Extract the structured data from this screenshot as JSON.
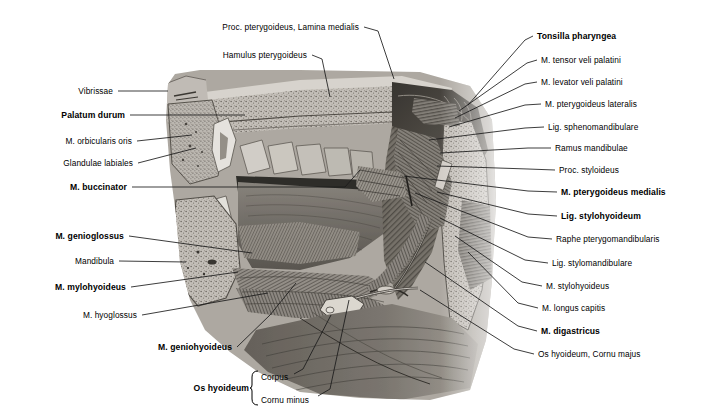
{
  "figure": {
    "background_color": "#ffffff",
    "text_color": "#000000",
    "leader_line_color": "#1a1a1a",
    "illustration": {
      "name": "head-neck-sagittal-halftone-illustration",
      "bounds": {
        "x": 155,
        "y": 70,
        "width": 343,
        "height": 330
      },
      "style": "grayscale halftone anatomical engraving"
    }
  },
  "labels_top": [
    {
      "id": "proc-pterygoideus-lamina-medialis",
      "text": "Proc. pterygoideus, Lamina medialis",
      "bold": false,
      "anchor": "right",
      "tx": 359,
      "ty": 27,
      "line": [
        [
          364,
          27
        ],
        [
          378,
          31
        ],
        [
          394,
          79
        ]
      ]
    },
    {
      "id": "hamulus-pterygoideus",
      "text": "Hamulus pterygoideus",
      "bold": false,
      "anchor": "right",
      "tx": 307,
      "ty": 55,
      "line": [
        [
          312,
          55
        ],
        [
          322,
          59
        ],
        [
          330,
          97
        ]
      ]
    }
  ],
  "labels_left": [
    {
      "id": "vibrissae",
      "text": "Vibrissae",
      "bold": false,
      "anchor": "right",
      "tx": 113,
      "ty": 91,
      "line": [
        [
          118,
          91
        ],
        [
          168,
          91
        ]
      ]
    },
    {
      "id": "palatum-durum",
      "text": "Palatum durum",
      "bold": true,
      "anchor": "right",
      "tx": 125,
      "ty": 115,
      "line": [
        [
          130,
          115
        ],
        [
          245,
          115
        ]
      ]
    },
    {
      "id": "m-orbicularis-oris",
      "text": "M. orbicularis oris",
      "bold": false,
      "anchor": "right",
      "tx": 132,
      "ty": 141,
      "line": [
        [
          137,
          141
        ],
        [
          192,
          135
        ]
      ]
    },
    {
      "id": "glandulae-labiales",
      "text": "Glandulae labiales",
      "bold": false,
      "anchor": "right",
      "tx": 133,
      "ty": 163,
      "line": [
        [
          138,
          163
        ],
        [
          196,
          148
        ]
      ]
    },
    {
      "id": "m-buccinator",
      "text": "M. buccinator",
      "bold": true,
      "anchor": "right",
      "tx": 127,
      "ty": 187,
      "line": [
        [
          132,
          187
        ],
        [
          345,
          187
        ],
        [
          360,
          170
        ]
      ]
    },
    {
      "id": "m-genioglossus",
      "text": "M. genioglossus",
      "bold": true,
      "anchor": "right",
      "tx": 124,
      "ty": 236,
      "line": [
        [
          129,
          236
        ],
        [
          252,
          253
        ]
      ]
    },
    {
      "id": "mandibula",
      "text": "Mandibula",
      "bold": false,
      "anchor": "right",
      "tx": 114,
      "ty": 261,
      "line": [
        [
          119,
          261
        ],
        [
          186,
          262
        ]
      ]
    },
    {
      "id": "m-mylohyoideus",
      "text": "M. mylohyoideus",
      "bold": true,
      "anchor": "right",
      "tx": 126,
      "ty": 287,
      "line": [
        [
          131,
          287
        ],
        [
          238,
          272
        ]
      ]
    },
    {
      "id": "m-hyoglossus",
      "text": "M. hyoglossus",
      "bold": false,
      "anchor": "right",
      "tx": 137,
      "ty": 315,
      "line": [
        [
          142,
          315
        ],
        [
          268,
          293
        ]
      ]
    },
    {
      "id": "m-geniohyoideus",
      "text": "M. geniohyoideus",
      "bold": true,
      "anchor": "right",
      "tx": 232,
      "ty": 347,
      "line": [
        [
          237,
          347
        ],
        [
          270,
          315
        ],
        [
          296,
          283
        ]
      ]
    }
  ],
  "labels_bottom": {
    "group_label": {
      "id": "os-hyoideum",
      "text": "Os hyoideum",
      "bold": true,
      "anchor": "right",
      "tx": 249,
      "ty": 388
    },
    "brace": {
      "x": 252,
      "y_top": 371,
      "y_bottom": 405,
      "width": 6
    },
    "items": [
      {
        "id": "os-hyoideum-corpus",
        "text": "Corpus",
        "bold": false,
        "anchor": "left",
        "tx": 261,
        "ty": 377,
        "line": [
          [
            294,
            374
          ],
          [
            303,
            369
          ],
          [
            331,
            315
          ]
        ]
      },
      {
        "id": "os-hyoideum-cornu-minus",
        "text": "Cornu minus",
        "bold": false,
        "anchor": "left",
        "tx": 261,
        "ty": 400,
        "line": [
          [
            318,
            396
          ],
          [
            330,
            389
          ],
          [
            349,
            300
          ]
        ]
      }
    ]
  },
  "labels_right": [
    {
      "id": "tonsilla-pharyngea",
      "text": "Tonsilla pharyngea",
      "bold": true,
      "anchor": "left",
      "tx": 537,
      "ty": 36,
      "line": [
        [
          533,
          36
        ],
        [
          525,
          40
        ],
        [
          468,
          105
        ]
      ]
    },
    {
      "id": "m-tensor-veli-palatini",
      "text": "M. tensor veli palatini",
      "bold": false,
      "anchor": "left",
      "tx": 541,
      "ty": 60,
      "line": [
        [
          537,
          60
        ],
        [
          527,
          63
        ],
        [
          459,
          111
        ]
      ]
    },
    {
      "id": "m-levator-veli-palatini",
      "text": "M. levator veli palatini",
      "bold": false,
      "anchor": "left",
      "tx": 541,
      "ty": 82,
      "line": [
        [
          537,
          82
        ],
        [
          525,
          84
        ],
        [
          455,
          118
        ]
      ]
    },
    {
      "id": "m-pterygoideus-lateralis",
      "text": "M. pterygoideus lateralis",
      "bold": false,
      "anchor": "left",
      "tx": 545,
      "ty": 104,
      "line": [
        [
          541,
          104
        ],
        [
          525,
          105
        ],
        [
          449,
          127
        ]
      ]
    },
    {
      "id": "lig-sphenomandibulare",
      "text": "Lig. sphenomandibulare",
      "bold": false,
      "anchor": "left",
      "tx": 548,
      "ty": 127,
      "line": [
        [
          544,
          127
        ],
        [
          525,
          128
        ],
        [
          429,
          140
        ]
      ]
    },
    {
      "id": "ramus-mandibulae",
      "text": "Ramus mandibulae",
      "bold": false,
      "anchor": "left",
      "tx": 555,
      "ty": 148,
      "line": [
        [
          551,
          148
        ],
        [
          528,
          148
        ],
        [
          440,
          153
        ]
      ]
    },
    {
      "id": "proc-styloideus",
      "text": "Proc. styloideus",
      "bold": false,
      "anchor": "left",
      "tx": 559,
      "ty": 170,
      "line": [
        [
          555,
          170
        ],
        [
          528,
          169
        ],
        [
          437,
          166
        ]
      ]
    },
    {
      "id": "m-pterygoideus-medialis",
      "text": "M. pterygoideus medialis",
      "bold": true,
      "anchor": "left",
      "tx": 561,
      "ty": 192,
      "line": [
        [
          557,
          192
        ],
        [
          528,
          191
        ],
        [
          404,
          176
        ]
      ]
    },
    {
      "id": "lig-stylohyoideum",
      "text": "Lig. stylohyoideum",
      "bold": true,
      "anchor": "left",
      "tx": 561,
      "ty": 216,
      "line": [
        [
          557,
          216
        ],
        [
          528,
          214
        ],
        [
          437,
          192
        ]
      ]
    },
    {
      "id": "raphe-pterygomandibularis",
      "text": "Raphe pterygomandibularis",
      "bold": false,
      "anchor": "left",
      "tx": 556,
      "ty": 239,
      "line": [
        [
          552,
          239
        ],
        [
          528,
          237
        ],
        [
          415,
          193
        ]
      ]
    },
    {
      "id": "lig-stylomandibulare",
      "text": "Lig. stylomandibulare",
      "bold": false,
      "anchor": "left",
      "tx": 552,
      "ty": 263,
      "line": [
        [
          548,
          263
        ],
        [
          525,
          260
        ],
        [
          440,
          218
        ]
      ]
    },
    {
      "id": "m-stylohyoideus",
      "text": "M. stylohyoideus",
      "bold": false,
      "anchor": "left",
      "tx": 546,
      "ty": 286,
      "line": [
        [
          542,
          286
        ],
        [
          522,
          282
        ],
        [
          455,
          236
        ]
      ]
    },
    {
      "id": "m-longus-capitis",
      "text": "M. longus capitis",
      "bold": false,
      "anchor": "left",
      "tx": 542,
      "ty": 308,
      "line": [
        [
          538,
          308
        ],
        [
          518,
          303
        ],
        [
          468,
          252
        ]
      ]
    },
    {
      "id": "m-digastricus",
      "text": "M. digastricus",
      "bold": true,
      "anchor": "left",
      "tx": 541,
      "ty": 331,
      "line": [
        [
          537,
          331
        ],
        [
          518,
          326
        ],
        [
          425,
          262
        ]
      ]
    },
    {
      "id": "os-hyoideum-cornu-majus",
      "text": "Os hyoideum, Cornu majus",
      "bold": false,
      "anchor": "left",
      "tx": 538,
      "ty": 354,
      "line": [
        [
          534,
          354
        ],
        [
          514,
          349
        ],
        [
          420,
          290
        ]
      ]
    }
  ]
}
